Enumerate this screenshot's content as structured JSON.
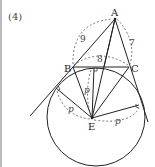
{
  "problem_tag": "(4)",
  "points": {
    "A": {
      "label": "A",
      "x": 115,
      "y": 19
    },
    "B": {
      "label": "B",
      "x": 73,
      "y": 67
    },
    "C": {
      "label": "C",
      "x": 129,
      "y": 67
    },
    "E": {
      "label": "E",
      "x": 92,
      "y": 118
    }
  },
  "lengths": {
    "AB": "9",
    "BC": "8",
    "AC": "7"
  },
  "radius_label": "p",
  "excircle": {
    "cx": 96,
    "cy": 117,
    "r": 49
  },
  "tangent_points": {
    "top": {
      "x": 94,
      "y": 68
    },
    "left": {
      "x": 56,
      "y": 88
    },
    "right": {
      "x": 139,
      "y": 105
    }
  },
  "colors": {
    "line": "#222222",
    "dashed": "#555555",
    "background": "#ffffff"
  }
}
